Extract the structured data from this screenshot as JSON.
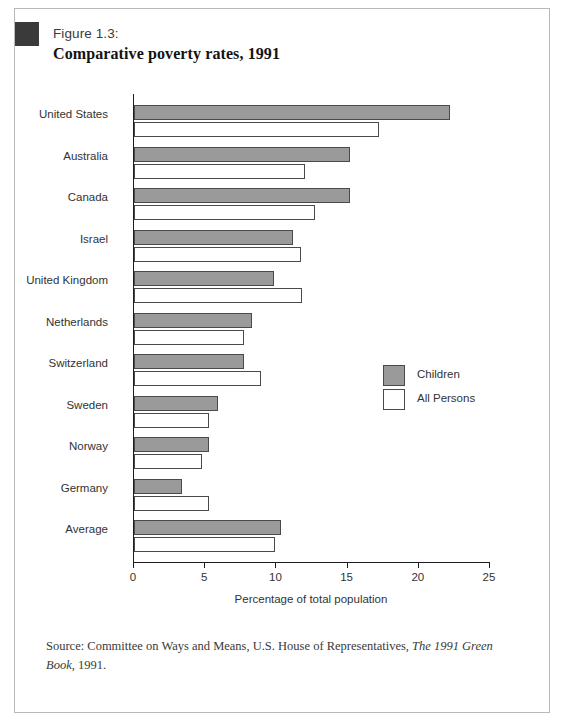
{
  "figure": {
    "number_label": "Figure 1.3:",
    "title": "Comparative poverty rates, 1991",
    "marker_icon": "black-square-marker"
  },
  "legend": {
    "position": "inside-right",
    "items": [
      {
        "label": "Children",
        "color": "#9a9a9a"
      },
      {
        "label": "All Persons",
        "color": "#ffffff"
      }
    ]
  },
  "source": {
    "prefix": "Source: Committee on Ways and Means, U.S. House of Representatives, ",
    "italic_title": "The 1991 Green Book",
    "suffix": ", 1991."
  },
  "chart_data": {
    "type": "bar",
    "orientation": "horizontal",
    "title": "Comparative poverty rates, 1991",
    "subtitle": "Figure 1.3:",
    "xlabel": "Percentage of total population",
    "ylabel": "",
    "xlim": [
      0,
      25
    ],
    "xticks": [
      0,
      5,
      10,
      15,
      20,
      25
    ],
    "xtick_labels": [
      "0",
      "5",
      "10",
      "15",
      "20",
      "25"
    ],
    "grid": false,
    "legend_position": "inside-right",
    "categories": [
      "United States",
      "Australia",
      "Canada",
      "Israel",
      "United Kingdom",
      "Netherlands",
      "Switzerland",
      "Sweden",
      "Norway",
      "Germany",
      "Average"
    ],
    "series": [
      {
        "name": "Children",
        "color": "#9a9a9a",
        "values": [
          22.2,
          15.2,
          15.2,
          11.2,
          9.8,
          8.3,
          7.7,
          5.9,
          5.3,
          3.4,
          10.3
        ]
      },
      {
        "name": "All Persons",
        "color": "#ffffff",
        "values": [
          17.2,
          12.0,
          12.7,
          11.7,
          11.8,
          7.7,
          8.9,
          5.3,
          4.8,
          5.3,
          9.9
        ]
      }
    ]
  }
}
